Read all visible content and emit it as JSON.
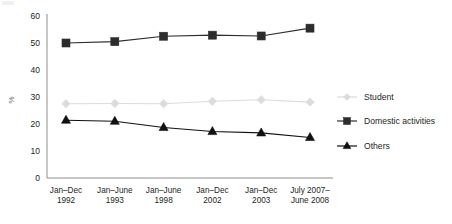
{
  "chart_data": {
    "type": "line",
    "title": "",
    "xlabel": "",
    "ylabel": "%",
    "ylim": [
      0,
      60
    ],
    "yticks": [
      0,
      10,
      20,
      30,
      40,
      50,
      60
    ],
    "grid": false,
    "legend_position": "right",
    "categories": [
      "Jan–Dec 1992",
      "Jan–June 1993",
      "Jan–June 1998",
      "Jan–Dec 2002",
      "Jan–Dec 2003",
      "July 2007–June 2008"
    ],
    "category_lines": [
      [
        "Jan–Dec",
        "1992"
      ],
      [
        "Jan–June",
        "1993"
      ],
      [
        "Jan–June",
        "1998"
      ],
      [
        "Jan–Dec",
        "2002"
      ],
      [
        "Jan–Dec",
        "2003"
      ],
      [
        "July 2007–",
        "June 2008"
      ]
    ],
    "series": [
      {
        "name": "Student",
        "marker": "diamond",
        "color": "#dcdcdc",
        "values": [
          27.5,
          27.6,
          27.5,
          28.4,
          29.0,
          28.1
        ]
      },
      {
        "name": "Domestic activities",
        "marker": "square",
        "color": "#2d2d2d",
        "values": [
          50.0,
          50.5,
          52.5,
          52.9,
          52.6,
          55.5
        ]
      },
      {
        "name": "Others",
        "marker": "triangle",
        "color": "#111111",
        "values": [
          21.4,
          21.0,
          18.7,
          17.2,
          16.7,
          15.0
        ]
      }
    ]
  },
  "legend": {
    "items": [
      {
        "label": "Student",
        "marker": "diamond-marker-icon",
        "color": "#dcdcdc"
      },
      {
        "label": "Domestic activities",
        "marker": "square-marker-icon",
        "color": "#2d2d2d"
      },
      {
        "label": "Others",
        "marker": "triangle-marker-icon",
        "color": "#111111"
      }
    ]
  },
  "axis": {
    "y_title": "%",
    "y_tick_labels": [
      "60",
      "50",
      "40",
      "30",
      "20",
      "10",
      "0"
    ]
  }
}
